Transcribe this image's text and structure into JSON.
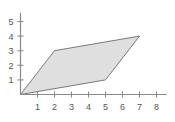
{
  "figure": {
    "title": "",
    "background_color": "#ffffff"
  },
  "chart_data": {
    "type": "scatter",
    "title": "",
    "xlabel": "",
    "ylabel": "",
    "grid": false,
    "legend": null,
    "xlim": [
      0,
      8.6
    ],
    "ylim": [
      0,
      5.6
    ],
    "x_ticks": [
      1,
      2,
      3,
      4,
      5,
      6,
      7,
      8
    ],
    "y_ticks": [
      1,
      2,
      3,
      4,
      5
    ],
    "x_tick_labels": [
      "1",
      "2",
      "3",
      "4",
      "5",
      "6",
      "7",
      "8"
    ],
    "y_tick_labels": [
      "1",
      "2",
      "3",
      "4",
      "5"
    ],
    "shapes": [
      {
        "name": "parallelogram",
        "kind": "polygon",
        "vertices": [
          [
            0,
            0
          ],
          [
            5,
            1
          ],
          [
            7,
            4
          ],
          [
            2,
            3
          ]
        ],
        "fill_color": "#d9d9d9",
        "stroke_color": "#7a7a7a"
      }
    ],
    "axis_color": "#8a8a8a",
    "tick_label_color": "#555555"
  }
}
